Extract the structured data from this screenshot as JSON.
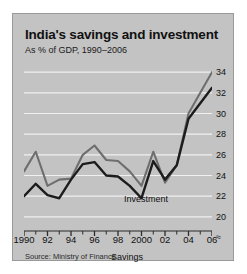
{
  "header": {
    "title": "India's savings and investment",
    "subtitle": "As % of GDP, 1990–2006"
  },
  "footer": {
    "source": "Source: Ministry of Finance"
  },
  "colors": {
    "panel_background": "#c3c3c3",
    "panel_border": "#9a9a9a",
    "gridline": "#f0f0f0",
    "investment_line": "#6e6e6e",
    "savings_line": "#1c1c1c",
    "text": "#111111"
  },
  "axis": {
    "y_break_symbol": "≈",
    "y_ticks": [
      34,
      32,
      30,
      28,
      26,
      24,
      22,
      20
    ],
    "x_ticks": [
      "1990",
      "92",
      "94",
      "96",
      "98",
      "2000",
      "02",
      "04",
      "06"
    ]
  },
  "labels": {
    "investment": "Investment",
    "savings": "Savings"
  },
  "chart_data": {
    "type": "line",
    "title": "India's savings and investment",
    "subtitle": "As % of GDP, 1990–2006",
    "xlabel": "",
    "ylabel": "As % of GDP",
    "xlim": [
      1990,
      2006
    ],
    "ylim": [
      19.5,
      34.5
    ],
    "yticks": [
      20,
      22,
      24,
      26,
      28,
      30,
      32,
      34
    ],
    "xticks": [
      1990,
      1992,
      1994,
      1996,
      1998,
      2000,
      2002,
      2004,
      2006
    ],
    "xticklabels": [
      "1990",
      "92",
      "94",
      "96",
      "98",
      "2000",
      "02",
      "04",
      "06"
    ],
    "grid": "horizontal",
    "legend": "inline-annotations",
    "axis_break": true,
    "x": [
      1990,
      1991,
      1992,
      1993,
      1994,
      1995,
      1996,
      1997,
      1998,
      1999,
      2000,
      2001,
      2002,
      2003,
      2004,
      2005,
      2006
    ],
    "series": [
      {
        "name": "Investment",
        "color": "#6e6e6e",
        "values": [
          24.4,
          26.3,
          23.0,
          23.6,
          23.7,
          26.0,
          26.9,
          25.5,
          25.4,
          24.4,
          23.0,
          26.3,
          23.3,
          25.0,
          30.0,
          32.0,
          34.0
        ]
      },
      {
        "name": "Savings",
        "color": "#1c1c1c",
        "values": [
          22.0,
          23.2,
          22.1,
          21.8,
          23.6,
          25.1,
          25.3,
          24.0,
          23.9,
          23.0,
          21.8,
          25.4,
          23.6,
          25.0,
          29.5,
          31.0,
          32.5
        ]
      }
    ]
  }
}
